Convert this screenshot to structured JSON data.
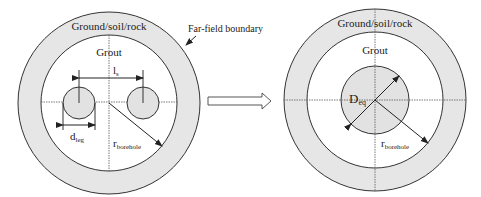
{
  "left_diagram": {
    "outer_label": "Ground/soil/rock",
    "grout_label": "Grout",
    "spacing_label": "l",
    "spacing_sub": "s",
    "leg_diameter_label": "d",
    "leg_diameter_sub": "leg",
    "radius_label": "r",
    "radius_sub": "borehole"
  },
  "callout": {
    "label": "Far-field boundary"
  },
  "transition_arrow": {
    "icon": "hollow-right-arrow-icon"
  },
  "right_diagram": {
    "outer_label": "Ground/soil/rock",
    "grout_label": "Grout",
    "equiv_diameter_label": "D",
    "equiv_diameter_sub": "eq",
    "radius_label": "r",
    "radius_sub": "borehole"
  },
  "colors": {
    "ground_fill": "#e6e6e6",
    "grout_fill": "#ffffff",
    "pipe_fill": "#e2e2e2",
    "stroke": "#333333"
  }
}
